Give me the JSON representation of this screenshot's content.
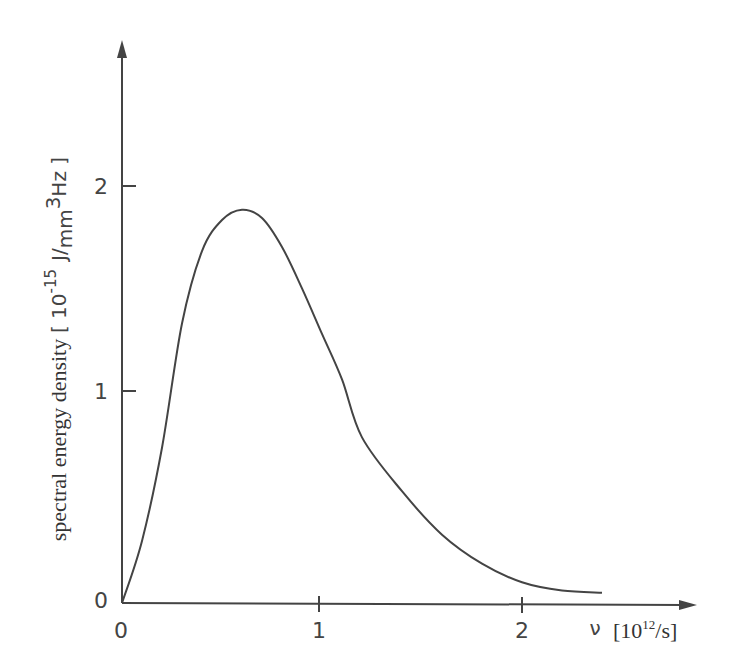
{
  "chart_data": {
    "type": "line",
    "title": "",
    "xlabel": "ν [10^12/s]",
    "ylabel": "spectral energy density [10^-15 J/mm^3 Hz]",
    "x_ticks": [
      "0",
      "1",
      "2"
    ],
    "y_ticks": [
      "0",
      "1",
      "2"
    ],
    "xlim": [
      0,
      2.5
    ],
    "ylim": [
      0,
      2.6
    ],
    "grid": false,
    "legend": null,
    "series": [
      {
        "name": "spectral energy density",
        "x": [
          0,
          0.1,
          0.2,
          0.3,
          0.4,
          0.5,
          0.6,
          0.7,
          0.8,
          0.9,
          1.0,
          1.1,
          1.2,
          1.4,
          1.6,
          1.8,
          2.0,
          2.2,
          2.4
        ],
        "values": [
          0,
          0.3,
          0.75,
          1.35,
          1.7,
          1.85,
          1.9,
          1.86,
          1.72,
          1.52,
          1.3,
          1.08,
          0.8,
          0.54,
          0.33,
          0.19,
          0.1,
          0.06,
          0.05
        ]
      }
    ]
  },
  "axes": {
    "x_tick_labels": [
      "0",
      "1",
      "2"
    ],
    "y_tick_labels": [
      "0",
      "1",
      "2"
    ],
    "x_symbol": "ν",
    "x_unit_open": "[",
    "x_unit_base": "10",
    "x_unit_exp": "12",
    "x_unit_tail": "/s]",
    "y_label": "spectral energy density",
    "y_unit_open": "[ 10",
    "y_unit_exp": "-15",
    "y_unit_j": "J",
    "y_unit_slash": "/",
    "y_unit_mm": "mm",
    "y_unit_cube": "3",
    "y_unit_hz": "Hz ]"
  }
}
